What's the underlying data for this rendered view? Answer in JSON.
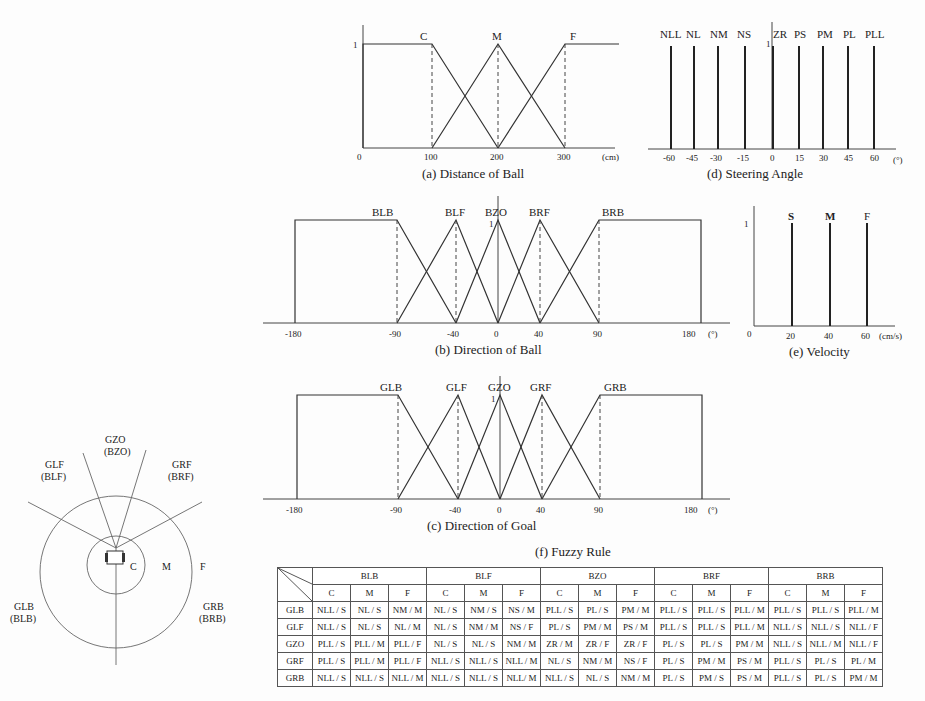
{
  "figures": {
    "a": {
      "caption": "(a) Distance of Ball",
      "unit": "(cm)",
      "y_tick": "1",
      "ticks": [
        "0",
        "100",
        "200",
        "300"
      ],
      "labels": [
        "C",
        "M",
        "F"
      ]
    },
    "d": {
      "caption": "(d) Steering Angle",
      "unit": "(°)",
      "y_tick": "1",
      "ticks": [
        "-60",
        "-45",
        "-30",
        "-15",
        "0",
        "15",
        "30",
        "45",
        "60"
      ],
      "labels": [
        "NLL",
        "NL",
        "NM",
        "NS",
        "ZR",
        "PS",
        "PM",
        "PL",
        "PLL"
      ]
    },
    "b": {
      "caption": "(b) Direction of Ball",
      "unit": "(°)",
      "y_tick": "1",
      "ticks": [
        "-180",
        "-90",
        "-40",
        "0",
        "40",
        "90",
        "180"
      ],
      "labels": [
        "BLB",
        "BLF",
        "BZO",
        "BRF",
        "BRB"
      ]
    },
    "e": {
      "caption": "(e) Velocity",
      "unit": "(cm/s)",
      "y_tick": "1",
      "ticks": [
        "0",
        "20",
        "40",
        "60"
      ],
      "labels": [
        "S",
        "M",
        "F"
      ]
    },
    "c": {
      "caption": "(c) Direction of Goal",
      "unit": "(°)",
      "y_tick": "1",
      "ticks": [
        "-180",
        "-90",
        "-40",
        "0",
        "40",
        "90",
        "180"
      ],
      "labels": [
        "GLB",
        "GLF",
        "GZO",
        "GRF",
        "GRB"
      ]
    }
  },
  "field_diagram": {
    "top": [
      "GZO",
      "(BZO)"
    ],
    "top_left": [
      "GLF",
      "(BLF)"
    ],
    "top_right": [
      "GRF",
      "(BRF)"
    ],
    "bottom_left": [
      "GLB",
      "(BLB)"
    ],
    "bottom_right": [
      "GRB",
      "(BRB)"
    ],
    "rings": [
      "C",
      "M",
      "F"
    ]
  },
  "rule_table": {
    "title": "(f) Fuzzy Rule",
    "ball_groups": [
      "BLB",
      "BLF",
      "BZO",
      "BRF",
      "BRB"
    ],
    "distance_cols": [
      "C",
      "M",
      "F"
    ],
    "rows": [
      {
        "goal": "GLB",
        "cells": [
          "NLL / S",
          "NL / S",
          "NM / M",
          "NL / S",
          "NM / S",
          "NS / M",
          "PLL / S",
          "PL / S",
          "PM / M",
          "PLL / S",
          "PLL / S",
          "PLL / M",
          "PLL / S",
          "PLL / S",
          "PLL / M"
        ]
      },
      {
        "goal": "GLF",
        "cells": [
          "NLL / S",
          "NL / S",
          "NL / M",
          "NL / S",
          "NM / M",
          "NS / F",
          "PL / S",
          "PM / M",
          "PS / M",
          "PLL / S",
          "PLL / S",
          "PLL / M",
          "NLL / S",
          "NLL / S",
          "NLL / F"
        ]
      },
      {
        "goal": "GZO",
        "cells": [
          "PLL / S",
          "PLL / M",
          "PLL / F",
          "NL / S",
          "NL / S",
          "NM / M",
          "ZR / M",
          "ZR / F",
          "ZR / F",
          "PL / S",
          "PL / S",
          "PM / M",
          "NLL / S",
          "NLL / M",
          "NLL / F"
        ]
      },
      {
        "goal": "GRF",
        "cells": [
          "PLL / S",
          "PLL / M",
          "PLL / F",
          "NLL / S",
          "NLL / S",
          "NLL / M",
          "NL / S",
          "NM / M",
          "NS / F",
          "PL / S",
          "PM / M",
          "PS / M",
          "PLL / S",
          "PL / S",
          "PL / M"
        ]
      },
      {
        "goal": "GRB",
        "cells": [
          "NLL / S",
          "NLL / S",
          "NLL / M",
          "NLL / S",
          "NLL / S",
          "NLL/ M",
          "NLL / S",
          "NL / S",
          "NM / M",
          "PL / S",
          "PM / S",
          "PS / M",
          "PLL / S",
          "PL / S",
          "PM / M"
        ]
      }
    ]
  },
  "chart_data": [
    {
      "type": "line",
      "title": "(a) Distance of Ball",
      "xlabel": "(cm)",
      "ylabel": "",
      "ylim": [
        0,
        1
      ],
      "series": [
        {
          "name": "C",
          "x": [
            0,
            100,
            200
          ],
          "y": [
            1,
            1,
            0
          ]
        },
        {
          "name": "M",
          "x": [
            100,
            200,
            300
          ],
          "y": [
            0,
            1,
            0
          ]
        },
        {
          "name": "F",
          "x": [
            200,
            300,
            350
          ],
          "y": [
            0,
            1,
            1
          ]
        }
      ]
    },
    {
      "type": "bar",
      "title": "(d) Steering Angle",
      "xlabel": "(°)",
      "ylim": [
        0,
        1
      ],
      "categories": [
        "NLL",
        "NL",
        "NM",
        "NS",
        "ZR",
        "PS",
        "PM",
        "PL",
        "PLL"
      ],
      "x": [
        -60,
        -45,
        -30,
        -15,
        0,
        15,
        30,
        45,
        60
      ],
      "values": [
        1,
        1,
        1,
        1,
        1,
        1,
        1,
        1,
        1
      ]
    },
    {
      "type": "line",
      "title": "(b) Direction of Ball",
      "xlabel": "(°)",
      "ylim": [
        0,
        1
      ],
      "series": [
        {
          "name": "BLB",
          "x": [
            -180,
            -90,
            -40
          ],
          "y": [
            1,
            1,
            0
          ]
        },
        {
          "name": "BLF",
          "x": [
            -90,
            -40,
            0
          ],
          "y": [
            0,
            1,
            0
          ]
        },
        {
          "name": "BZO",
          "x": [
            -40,
            0,
            40
          ],
          "y": [
            0,
            1,
            0
          ]
        },
        {
          "name": "BRF",
          "x": [
            0,
            40,
            90
          ],
          "y": [
            0,
            1,
            0
          ]
        },
        {
          "name": "BRB",
          "x": [
            40,
            90,
            180
          ],
          "y": [
            0,
            1,
            1
          ]
        }
      ]
    },
    {
      "type": "bar",
      "title": "(e) Velocity",
      "xlabel": "(cm/s)",
      "ylim": [
        0,
        1
      ],
      "categories": [
        "S",
        "M",
        "F"
      ],
      "x": [
        20,
        40,
        60
      ],
      "values": [
        1,
        1,
        1
      ]
    },
    {
      "type": "line",
      "title": "(c) Direction of Goal",
      "xlabel": "(°)",
      "ylim": [
        0,
        1
      ],
      "series": [
        {
          "name": "GLB",
          "x": [
            -180,
            -90,
            -40
          ],
          "y": [
            1,
            1,
            0
          ]
        },
        {
          "name": "GLF",
          "x": [
            -90,
            -40,
            0
          ],
          "y": [
            0,
            1,
            0
          ]
        },
        {
          "name": "GZO",
          "x": [
            -40,
            0,
            40
          ],
          "y": [
            0,
            1,
            0
          ]
        },
        {
          "name": "GRF",
          "x": [
            0,
            40,
            90
          ],
          "y": [
            0,
            1,
            0
          ]
        },
        {
          "name": "GRB",
          "x": [
            40,
            90,
            180
          ],
          "y": [
            0,
            1,
            1
          ]
        }
      ]
    }
  ]
}
